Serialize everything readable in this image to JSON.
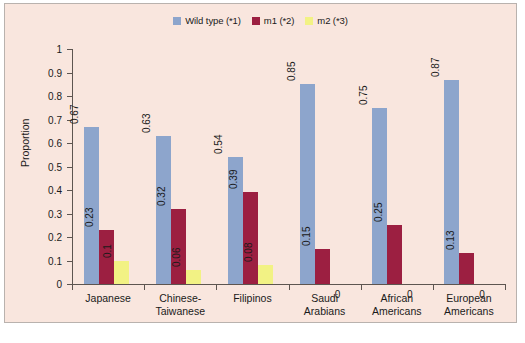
{
  "figure": {
    "background_color": "#f9e6de",
    "border_color": "#b9b2ae",
    "page_color": "#ffffff"
  },
  "legend": {
    "position": "top-center",
    "items": [
      {
        "label": "Wild type (*1)",
        "color": "#8da5cc",
        "icon": "legend-swatch-icon"
      },
      {
        "label": "m1 (*2)",
        "color": "#9c1f41",
        "icon": "legend-swatch-icon"
      },
      {
        "label": "m2 (*3)",
        "color": "#f2f284",
        "icon": "legend-swatch-icon"
      }
    ]
  },
  "chart_data": {
    "type": "bar",
    "title": "",
    "xlabel": "",
    "ylabel": "Proportion",
    "ylim": [
      0,
      1
    ],
    "yticks": [
      "0",
      "0.1",
      "0.2",
      "0.3",
      "0.4",
      "0.5",
      "0.6",
      "0.7",
      "0.8",
      "0.9",
      "1"
    ],
    "grid": false,
    "legend_position": "top-center",
    "categories": [
      "Japanese",
      "Chinese-\nTaiwanese",
      "Filipinos",
      "Saudi\nArabians",
      "African\nAmericans",
      "European\nAmericans"
    ],
    "series": [
      {
        "name": "Wild type (*1)",
        "color": "#8da5cc",
        "values": [
          0.67,
          0.63,
          0.54,
          0.85,
          0.75,
          0.87
        ],
        "labels": [
          "0.67",
          "0.63",
          "0.54",
          "0.85",
          "0.75",
          "0.87"
        ]
      },
      {
        "name": "m1 (*2)",
        "color": "#9c1f41",
        "values": [
          0.23,
          0.32,
          0.39,
          0.15,
          0.25,
          0.13
        ],
        "labels": [
          "0.23",
          "0.32",
          "0.39",
          "0.15",
          "0.25",
          "0.13"
        ]
      },
      {
        "name": "m2 (*3)",
        "color": "#f2f284",
        "values": [
          0.1,
          0.06,
          0.08,
          0,
          0,
          0
        ],
        "labels": [
          "0.1",
          "0.06",
          "0.08",
          "0",
          "0",
          "0"
        ]
      }
    ]
  }
}
